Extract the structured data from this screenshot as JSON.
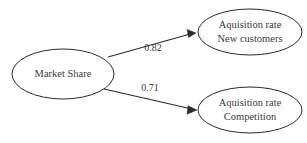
{
  "diagram": {
    "type": "path-diagram",
    "background_color": "#ffffff",
    "stroke_color": "#2b2b2b",
    "text_color": "#3a3a3a",
    "nodes": [
      {
        "id": "market-share",
        "shape": "ellipse",
        "lines": [
          "Market Share"
        ],
        "cx": 63,
        "cy": 74,
        "rx": 51,
        "ry": 25
      },
      {
        "id": "acquisition-new-customers",
        "shape": "ellipse",
        "lines": [
          "Aquisition rate",
          "New customers"
        ],
        "cx": 250,
        "cy": 32,
        "rx": 52,
        "ry": 23
      },
      {
        "id": "acquisition-competition",
        "shape": "ellipse",
        "lines": [
          "Aquisition rate",
          "Competition"
        ],
        "cx": 250,
        "cy": 110,
        "rx": 52,
        "ry": 23
      }
    ],
    "edges": [
      {
        "id": "edge-new-customers",
        "from": "market-share",
        "to": "acquisition-new-customers",
        "label": "0.82",
        "label_x": 153,
        "label_y": 49,
        "x1": 108,
        "y1": 57,
        "x2": 196,
        "y2": 33,
        "arrow": "end"
      },
      {
        "id": "edge-competition",
        "from": "market-share",
        "to": "acquisition-competition",
        "label": "0.71",
        "label_x": 150,
        "label_y": 89,
        "x1": 104,
        "y1": 89,
        "x2": 197,
        "y2": 110,
        "arrow": "end"
      }
    ]
  }
}
